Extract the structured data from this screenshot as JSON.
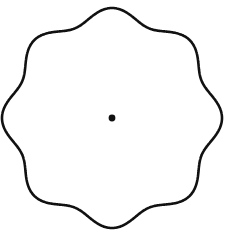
{
  "figure": {
    "background_color": "#ffffff",
    "width": 229,
    "height": 237
  },
  "chart_data": {
    "type": "line",
    "subtitle": "",
    "xlabel": "",
    "ylabel": "",
    "grid": false,
    "legend": false,
    "legend_position": "none",
    "axis_visible": false,
    "tick_labels_x": [],
    "tick_labels_y": [],
    "xlim": [
      0,
      229
    ],
    "ylim": [
      0,
      237
    ],
    "annotations": [],
    "curve": {
      "name": "rosette-outline",
      "equation": "r(theta) = r_mean + amplitude * cos(n * (theta - phase))",
      "center_x": 112,
      "center_y": 118,
      "lobes": 8,
      "outer_radius": 110,
      "inner_radius": 97,
      "r_mean": 103.5,
      "amplitude": 6.5,
      "phase_degrees": 90,
      "sample_count": 720,
      "closed": true,
      "stroke_color": "#111111",
      "stroke_width": 2.6,
      "fill": "none"
    },
    "lobe_tips": [
      {
        "label": "top",
        "angle_deg": 90,
        "x": 112,
        "y": 8
      },
      {
        "label": "top-right",
        "angle_deg": 45,
        "x": 190,
        "y": 40
      },
      {
        "label": "right",
        "angle_deg": 0,
        "x": 222,
        "y": 118
      },
      {
        "label": "bottom-right",
        "angle_deg": 315,
        "x": 190,
        "y": 196
      },
      {
        "label": "bottom",
        "angle_deg": 270,
        "x": 112,
        "y": 228
      },
      {
        "label": "bottom-left",
        "angle_deg": 225,
        "x": 34,
        "y": 196
      },
      {
        "label": "left",
        "angle_deg": 180,
        "x": 2,
        "y": 118
      },
      {
        "label": "top-left",
        "angle_deg": 135,
        "x": 34,
        "y": 40
      }
    ],
    "valleys": [
      {
        "label": "upper-left-valley",
        "angle_deg": 112.5,
        "x": 75,
        "y": 28
      },
      {
        "label": "upper-right-valley",
        "angle_deg": 67.5,
        "x": 149,
        "y": 28
      },
      {
        "label": "right-upper-valley",
        "angle_deg": 22.5,
        "x": 202,
        "y": 81
      },
      {
        "label": "right-lower-valley",
        "angle_deg": 337.5,
        "x": 202,
        "y": 155
      },
      {
        "label": "lower-right-valley",
        "angle_deg": 292.5,
        "x": 149,
        "y": 208
      },
      {
        "label": "lower-left-valley",
        "angle_deg": 247.5,
        "x": 75,
        "y": 208
      },
      {
        "label": "left-lower-valley",
        "angle_deg": 202.5,
        "x": 22,
        "y": 155
      },
      {
        "label": "left-upper-valley",
        "angle_deg": 157.5,
        "x": 22,
        "y": 81
      }
    ],
    "center_marker": {
      "name": "center-point",
      "shape": "filled-circle",
      "x": 112,
      "y": 118,
      "radius": 3.4,
      "color": "#111111"
    }
  },
  "colors": {
    "stroke": "#111111",
    "marker": "#111111",
    "background": "#ffffff"
  }
}
